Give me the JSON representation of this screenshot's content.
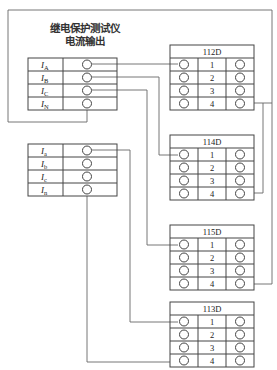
{
  "tester": {
    "title_line1": "继电保护测试仪",
    "title_line2": "电流输出"
  },
  "source_tables": [
    {
      "rows": [
        {
          "label": "I",
          "sub": "A"
        },
        {
          "label": "I",
          "sub": "B"
        },
        {
          "label": "I",
          "sub": "C"
        },
        {
          "label": "I",
          "sub": "N"
        }
      ]
    },
    {
      "rows": [
        {
          "label": "I",
          "sub": "a"
        },
        {
          "label": "I",
          "sub": "b"
        },
        {
          "label": "I",
          "sub": "c"
        },
        {
          "label": "I",
          "sub": "n"
        }
      ]
    }
  ],
  "terminal_blocks": [
    {
      "name": "112D",
      "terminals": [
        "1",
        "2",
        "3",
        "4"
      ]
    },
    {
      "name": "114D",
      "terminals": [
        "1",
        "2",
        "3",
        "4"
      ]
    },
    {
      "name": "115D",
      "terminals": [
        "1",
        "2",
        "3",
        "4"
      ]
    },
    {
      "name": "113D",
      "terminals": [
        "1",
        "2",
        "3",
        "4"
      ]
    }
  ],
  "connections": [
    {
      "from": "IA",
      "to": "112D-1"
    },
    {
      "from": "IB",
      "to": "114D-1"
    },
    {
      "from": "IC",
      "to": "115D-1"
    },
    {
      "from": "Ia",
      "to": "113D-1"
    },
    {
      "from": "In",
      "to": "113D-4"
    },
    {
      "from": "IN",
      "to": "112D-4 / 114D-4 / 115D-4 (common return)"
    }
  ],
  "colors": {
    "line": "#444444",
    "wire": "#666666"
  }
}
